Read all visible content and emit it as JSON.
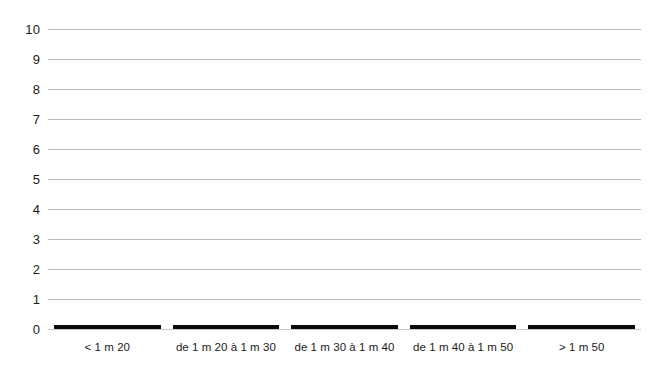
{
  "chart_data": {
    "type": "bar",
    "title": "",
    "subtitle": "",
    "xlabel": "",
    "ylabel": "",
    "categories": [
      "< 1 m 20",
      "de 1 m 20 à 1 m 30",
      "de 1 m 30 à 1 m 40",
      "de 1 m 40 à 1 m 50",
      "> 1 m 50"
    ],
    "values": [
      0.12,
      0.11,
      0.1,
      0.1,
      0.09
    ],
    "series": [
      {
        "name": "",
        "values": [
          0.12,
          0.11,
          0.1,
          0.1,
          0.09
        ]
      }
    ],
    "ylim": [
      0,
      10
    ],
    "xlim": [
      0,
      5
    ],
    "y_ticks": [
      0,
      1,
      2,
      3,
      4,
      5,
      6,
      7,
      8,
      9,
      10
    ],
    "y_tick_labels": [
      "0",
      "1",
      "2",
      "3",
      "4",
      "5",
      "6",
      "7",
      "8",
      "9",
      "10"
    ],
    "grid": true,
    "grid_axis": "y",
    "legend": false,
    "legend_position": "none",
    "annotations": [],
    "colors": {
      "bar": "#0a0a0a",
      "gridline": "#b9b9b9",
      "baseline": "#c9c9c9",
      "text": "#1a1a1a",
      "background": "#ffffff"
    },
    "bar_width_ratio": 0.9
  }
}
